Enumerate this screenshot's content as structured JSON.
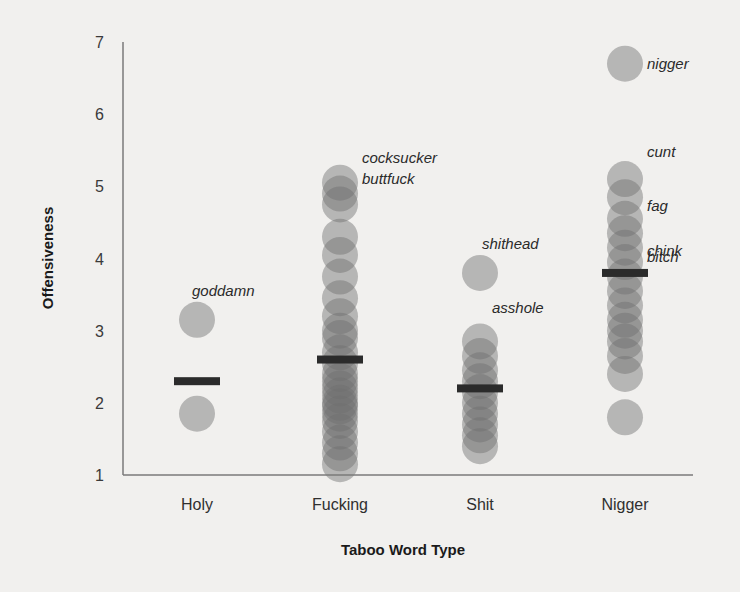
{
  "chart_data": {
    "type": "scatter",
    "title": "",
    "xlabel": "Taboo Word Type",
    "ylabel": "Offensiveness",
    "ylim": [
      1,
      7
    ],
    "yticks": [
      1,
      2,
      3,
      4,
      5,
      6,
      7
    ],
    "grid": false,
    "legend": null,
    "categories": [
      "Holy",
      "Fucking",
      "Shit",
      "Nigger"
    ],
    "series": [
      {
        "name": "Holy",
        "points": [
          3.15,
          1.85
        ],
        "mean": 2.3,
        "annotations": [
          {
            "label": "goddamn",
            "y": 3.15
          }
        ]
      },
      {
        "name": "Fucking",
        "points": [
          5.05,
          4.9,
          4.75,
          4.3,
          4.05,
          3.75,
          3.45,
          3.2,
          3.0,
          2.9,
          2.7,
          2.55,
          2.4,
          2.3,
          2.2,
          2.1,
          2.0,
          1.95,
          1.85,
          1.75,
          1.6,
          1.45,
          1.3,
          1.15
        ],
        "mean": 2.6,
        "annotations": [
          {
            "label": "cocksucker",
            "y": 5.05
          },
          {
            "label": "buttfuck",
            "y": 4.75
          }
        ]
      },
      {
        "name": "Shit",
        "points": [
          3.8,
          2.85,
          2.65,
          2.45,
          2.3,
          2.15,
          2.0,
          1.85,
          1.7,
          1.55,
          1.4
        ],
        "mean": 2.2,
        "annotations": [
          {
            "label": "shithead",
            "y": 3.8
          },
          {
            "label": "asshole",
            "y": 2.85
          }
        ]
      },
      {
        "name": "Nigger",
        "points": [
          6.7,
          5.1,
          4.85,
          4.55,
          4.35,
          4.15,
          3.95,
          3.75,
          3.55,
          3.35,
          3.15,
          3.0,
          2.85,
          2.65,
          2.4,
          1.8
        ],
        "mean": 3.8,
        "annotations": [
          {
            "label": "nigger",
            "y": 6.7
          },
          {
            "label": "cunt",
            "y": 5.1
          },
          {
            "label": "fag",
            "y": 4.55
          },
          {
            "label": "chink",
            "y": 4.15
          },
          {
            "label": "bitch",
            "y": 3.95
          }
        ]
      }
    ]
  },
  "colors": {
    "background": "#f1f0ee",
    "axis": "#7a7a7a",
    "point": "#6e6e6e",
    "mean_bar": "#2b2b2b"
  }
}
